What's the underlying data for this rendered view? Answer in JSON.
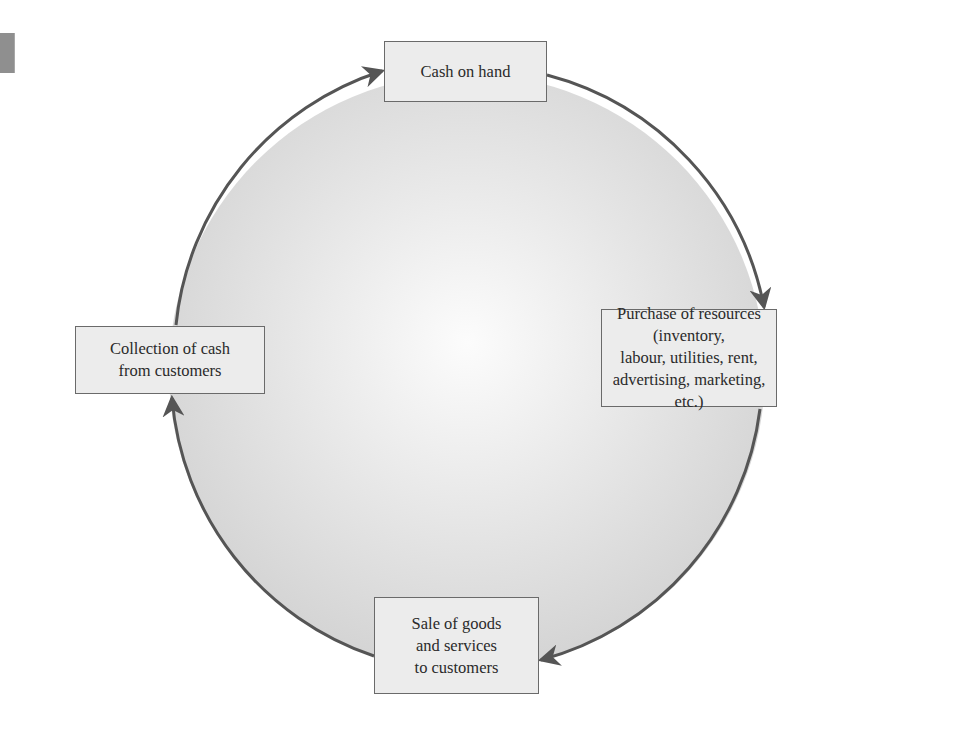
{
  "diagram": {
    "type": "cycle",
    "colors": {
      "circle_fill_center": "#fbfbfb",
      "circle_fill_edge": "#d6d6d6",
      "circle_stroke": "#555555",
      "arrow": "#555555",
      "node_fill": "#ececec",
      "node_border": "#6a6a6a",
      "text": "#2a2a2a"
    },
    "nodes": [
      {
        "id": "cash",
        "label": "Cash on hand"
      },
      {
        "id": "purchase",
        "label": "Purchase of resources (inventory,\nlabour, utilities, rent,\nadvertising, marketing, etc.)"
      },
      {
        "id": "sale",
        "label": "Sale of goods\nand services\nto customers"
      },
      {
        "id": "collection",
        "label": "Collection of cash\nfrom customers"
      }
    ],
    "flow": [
      {
        "from": "cash",
        "to": "purchase"
      },
      {
        "from": "purchase",
        "to": "sale"
      },
      {
        "from": "sale",
        "to": "collection"
      },
      {
        "from": "collection",
        "to": "cash"
      }
    ]
  }
}
